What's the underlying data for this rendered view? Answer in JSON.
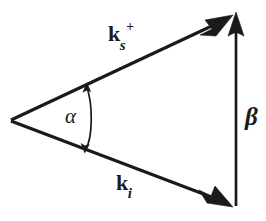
{
  "figure": {
    "kind": "vector-triangle-diagram",
    "background_color": "#ffffff",
    "stroke_color": "#1a1a1a",
    "width": 266,
    "height": 221
  },
  "labels": {
    "scattered_vector": {
      "symbol": "k",
      "subscript": "s",
      "superscript": "+",
      "full": "ks+",
      "name": "scattered-wavevector-label"
    },
    "incident_vector": {
      "symbol": "k",
      "subscript": "i",
      "superscript": "",
      "full": "ki",
      "name": "incident-wavevector-label"
    },
    "vertical_vector": {
      "symbol": "β",
      "full": "β",
      "name": "beta-label"
    },
    "angle": {
      "symbol": "α",
      "full": "α",
      "name": "alpha-label"
    }
  },
  "geometry": {
    "apex": {
      "x": 10,
      "y": 120
    },
    "scattered_tip": {
      "x": 233,
      "y": 15
    },
    "incident_tip": {
      "x": 233,
      "y": 207
    },
    "beta_bottom": {
      "x": 236,
      "y": 205
    },
    "beta_top": {
      "x": 236,
      "y": 14
    },
    "arc_radius": 80,
    "arc_start": {
      "x": 86,
      "y": 84
    },
    "arc_end": {
      "x": 85,
      "y": 151
    }
  }
}
